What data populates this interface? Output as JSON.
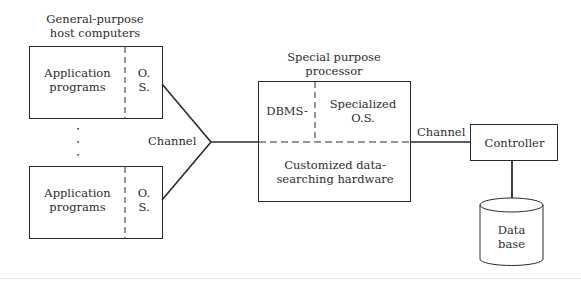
{
  "diagram": {
    "host_group_title_line1": "General-purpose",
    "host_group_title_line2": "host computers",
    "host_top": {
      "app_line1": "Application",
      "app_line2": "programs",
      "os_line1": "O.",
      "os_line2": "S."
    },
    "host_bottom": {
      "app_line1": "Application",
      "app_line2": "programs",
      "os_line1": "O.",
      "os_line2": "S."
    },
    "ellipsis_dots": [
      "•",
      "•",
      "•"
    ],
    "channel_left_label": "Channel",
    "processor_title_line1": "Special purpose",
    "processor_title_line2": "processor",
    "processor": {
      "dbms_label": "DBMS-",
      "specialized_os_line1": "Specialized",
      "specialized_os_line2": "O.S.",
      "hardware_line1": "Customized data-",
      "hardware_line2": "searching hardware"
    },
    "channel_right_label": "Channel",
    "controller_label": "Controller",
    "database_line1": "Data",
    "database_line2": "base",
    "colors": {
      "line": "#2a2a2a",
      "text": "#2e2e2e",
      "background": "#ffffff"
    }
  }
}
